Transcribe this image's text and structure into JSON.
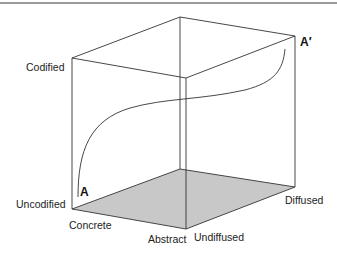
{
  "diagram": {
    "type": "3d-cube-information-space",
    "axes": {
      "codification": {
        "high": "Codified",
        "low": "Uncodified"
      },
      "abstraction": {
        "low": "Concrete",
        "high": "Abstract"
      },
      "diffusion": {
        "low": "Undiffused",
        "high": "Diffused"
      }
    },
    "points": {
      "start": "A",
      "end": "A′"
    },
    "colors": {
      "line": "#333333",
      "floor": "#c8c8c8",
      "top_rule": "#9a9a9a"
    }
  }
}
